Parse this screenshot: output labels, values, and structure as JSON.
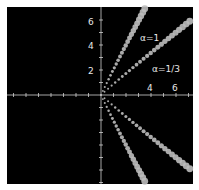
{
  "chart_data": {
    "type": "scatter",
    "title": "",
    "xlabel": "",
    "ylabel": "",
    "background": "#000000",
    "axis_color": "#cfcfcf",
    "dot_color": "#bdbdbd",
    "xlim": [
      -7.5,
      7.3
    ],
    "ylim": [
      -7.1,
      7.0
    ],
    "x_ticks": [
      4,
      6
    ],
    "y_ticks": [
      2,
      4,
      6
    ],
    "grid": false,
    "legend": null,
    "annotations": [
      {
        "text": "α=1",
        "x": 3.9,
        "y": 4.6
      },
      {
        "text": "α=1/3",
        "x": 4.6,
        "y": 2.1
      }
    ],
    "series": [
      {
        "name": "α=1 (upper)",
        "end": [
          3.5,
          6.9
        ],
        "n": 24
      },
      {
        "name": "α=1/3 (upper)",
        "end": [
          7.1,
          5.9
        ],
        "n": 26
      },
      {
        "name": "α=1/3 (lower)",
        "end": [
          7.1,
          -5.9
        ],
        "n": 26
      },
      {
        "name": "α=1 (lower)",
        "end": [
          3.5,
          -6.9
        ],
        "n": 24
      }
    ]
  },
  "labels": {
    "y6": "6",
    "y4": "4",
    "y2": "2",
    "x4": "4",
    "x6": "6",
    "alpha1": "α=1",
    "alpha13": "α=1/3"
  }
}
